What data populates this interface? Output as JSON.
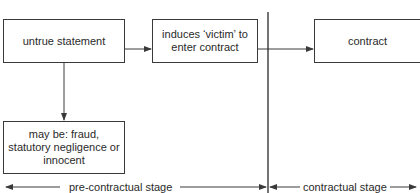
{
  "diagram": {
    "boxes": {
      "untrue_statement": "untrue statement",
      "induces_victim": "induces ‘victim’ to enter contract",
      "contract": "contract",
      "may_be": "may be: fraud, statutory negligence or innocent"
    },
    "stages": {
      "pre_contractual": "pre-contractual stage",
      "contractual": "contractual stage"
    },
    "colors": {
      "line": "#3a3a3a",
      "text": "#2a2a2a",
      "background": "#ffffff"
    }
  }
}
